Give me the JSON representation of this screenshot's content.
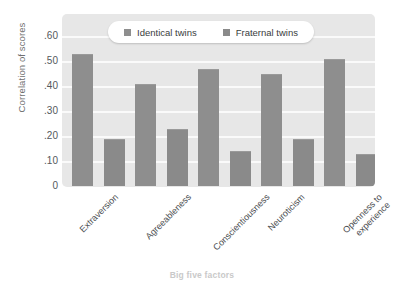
{
  "chart_data": {
    "type": "bar",
    "title": "",
    "xlabel": "Big five factors",
    "ylabel": "Correlation of scores",
    "categories": [
      "Extraversion",
      "Agreeableness",
      "Conscientiousness",
      "Neuroticism",
      "Openness to experience"
    ],
    "series": [
      {
        "name": "Identical twins",
        "values": [
          0.53,
          0.41,
          0.47,
          0.45,
          0.51
        ],
        "color": "#8e8e8e"
      },
      {
        "name": "Fraternal twins",
        "values": [
          0.19,
          0.23,
          0.14,
          0.19,
          0.13
        ],
        "color": "#8a8a8a"
      }
    ],
    "ylim": [
      0,
      0.6
    ],
    "ytick_values": [
      0.6,
      0.5,
      0.4,
      0.3,
      0.2,
      0.1,
      0
    ],
    "ytick_labels": [
      ".60",
      ".50",
      ".40",
      ".30",
      ".20",
      ".10",
      "0"
    ],
    "grid": true,
    "grid_color": "#fafafa",
    "plot_background": "#e7e7e7",
    "legend_position": "top-center",
    "legend_background": "#ffffff",
    "xtick_rotation": -45
  },
  "legend": {
    "items": [
      {
        "label": "Identical twins",
        "swatch_icon": "square-swatch-icon"
      },
      {
        "label": "Fraternal twins",
        "swatch_icon": "square-swatch-icon"
      }
    ]
  },
  "axes": {
    "y_title": "Correlation of scores",
    "x_title": "Big five factors"
  }
}
